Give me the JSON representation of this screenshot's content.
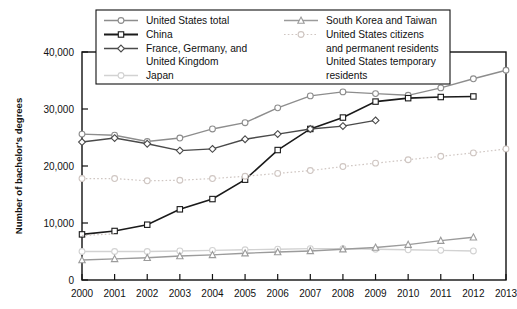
{
  "chart_data": {
    "type": "line",
    "title": "",
    "xlabel": "",
    "ylabel": "Number of bachelor's degrees",
    "x": [
      2000,
      2001,
      2002,
      2003,
      2004,
      2005,
      2006,
      2007,
      2008,
      2009,
      2010,
      2011,
      2012,
      2013
    ],
    "xlim": [
      2000,
      2013
    ],
    "ylim": [
      0,
      40000
    ],
    "yticks": [
      0,
      10000,
      20000,
      30000,
      40000
    ],
    "ytick_labels": [
      "0",
      "10,000",
      "20,000",
      "30,000",
      "40,000"
    ],
    "xtick_labels": [
      "2000",
      "2001",
      "2002",
      "2003",
      "2004",
      "2005",
      "2006",
      "2007",
      "2008",
      "2009",
      "2010",
      "2011",
      "2012",
      "2013"
    ],
    "grid": false,
    "legend_position": "top",
    "series": [
      {
        "name": "United States total",
        "marker": "circle",
        "color": "#8d8d8d",
        "dash": "none",
        "x": [
          2000,
          2001,
          2002,
          2003,
          2004,
          2005,
          2006,
          2007,
          2008,
          2009,
          2010,
          2011,
          2012,
          2013
        ],
        "values": [
          25600,
          25400,
          24300,
          24900,
          26500,
          27600,
          30200,
          32300,
          33000,
          32700,
          32400,
          33700,
          35300,
          36800
        ]
      },
      {
        "name": "China",
        "marker": "square",
        "color": "#1a1a1a",
        "dash": "none",
        "x": [
          2000,
          2001,
          2002,
          2003,
          2004,
          2005,
          2006,
          2007,
          2008,
          2009,
          2010,
          2011,
          2012
        ],
        "values": [
          8000,
          8600,
          9700,
          12400,
          14200,
          17600,
          22800,
          26500,
          28500,
          31300,
          31900,
          32100,
          32200
        ]
      },
      {
        "name": "France, Germany, and United Kingdom",
        "marker": "diamond",
        "color": "#4a4a4a",
        "dash": "none",
        "x": [
          2000,
          2001,
          2002,
          2003,
          2004,
          2005,
          2006,
          2007,
          2008,
          2009
        ],
        "values": [
          24200,
          24900,
          23900,
          22700,
          23000,
          24700,
          25600,
          26500,
          27000,
          28000
        ]
      },
      {
        "name": "Japan",
        "marker": "circle",
        "color": "#d2d2d2",
        "dash": "none",
        "x": [
          2000,
          2001,
          2002,
          2003,
          2004,
          2005,
          2006,
          2007,
          2008,
          2009,
          2010,
          2011,
          2012
        ],
        "values": [
          5000,
          5000,
          5000,
          5100,
          5200,
          5300,
          5400,
          5500,
          5500,
          5400,
          5300,
          5200,
          5100
        ]
      },
      {
        "name": "South Korea and Taiwan",
        "marker": "triangle",
        "color": "#9b9b9b",
        "dash": "none",
        "x": [
          2000,
          2001,
          2002,
          2003,
          2004,
          2005,
          2006,
          2007,
          2008,
          2009,
          2010,
          2011,
          2012
        ],
        "values": [
          3500,
          3700,
          3900,
          4200,
          4400,
          4700,
          4900,
          5100,
          5400,
          5700,
          6200,
          6900,
          7500
        ]
      },
      {
        "name": "United States citizens and permanent residents",
        "marker": "circle",
        "color": "#cfc6c2",
        "dash": "dotted",
        "x": [
          2000,
          2001,
          2002,
          2003,
          2004,
          2005,
          2006,
          2007,
          2008,
          2009,
          2010,
          2011,
          2012,
          2013
        ],
        "values": [
          17800,
          17800,
          17400,
          17500,
          17800,
          18200,
          18700,
          19200,
          19900,
          20500,
          21100,
          21700,
          22300,
          23000
        ]
      },
      {
        "name": "United States temporary residents",
        "marker": "none",
        "color": "#cfc6c2",
        "dash": "dotted",
        "x": [
          2000,
          2001
        ],
        "values": [
          7800,
          8100
        ]
      }
    ]
  },
  "legend": {
    "items": [
      {
        "label": "United States total",
        "marker": "circle",
        "color": "#8d8d8d",
        "dash": "none"
      },
      {
        "label": "China",
        "marker": "square",
        "color": "#1a1a1a",
        "dash": "none"
      },
      {
        "label": "France, Germany, and",
        "marker": "diamond",
        "color": "#4a4a4a",
        "dash": "none"
      },
      {
        "label": "United Kingdom",
        "marker": "none",
        "color": "#4a4a4a",
        "dash": "none"
      },
      {
        "label": "Japan",
        "marker": "circle",
        "color": "#d2d2d2",
        "dash": "none"
      },
      {
        "label": "South Korea and Taiwan",
        "marker": "triangle",
        "color": "#9b9b9b",
        "dash": "none"
      },
      {
        "label": "United States citizens",
        "marker": "circle",
        "color": "#cfc6c2",
        "dash": "dotted"
      },
      {
        "label": "and permanent residents",
        "marker": "none",
        "color": "#cfc6c2",
        "dash": "none"
      },
      {
        "label": "United States temporary",
        "marker": "none",
        "color": "#cfc6c2",
        "dash": "none"
      },
      {
        "label": "residents",
        "marker": "none",
        "color": "#cfc6c2",
        "dash": "none"
      }
    ]
  },
  "axis": {
    "ylabel": "Number of bachelor's degrees"
  }
}
